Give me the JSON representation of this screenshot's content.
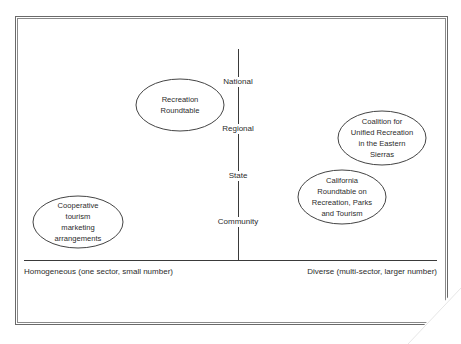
{
  "diagram": {
    "vertical_axis": {
      "levels": [
        {
          "label": "National",
          "y": 82
        },
        {
          "label": "Regional",
          "y": 129
        },
        {
          "label": "State",
          "y": 176
        },
        {
          "label": "Community",
          "y": 222
        }
      ]
    },
    "horizontal_axis": {
      "left_label": "Homogeneous (one sector, small number)",
      "right_label": "Diverse (multi-sector, larger number)"
    },
    "nodes": [
      {
        "id": "recreation-roundtable",
        "label": "Recreation\nRoundtable",
        "cx": 180,
        "cy": 105,
        "rx": 44,
        "ry": 26
      },
      {
        "id": "coalition-eastern-sierras",
        "label": "Coalition for\nUnified Recreation\nin the Eastern\nSierras",
        "cx": 382,
        "cy": 138,
        "rx": 44,
        "ry": 27
      },
      {
        "id": "california-roundtable",
        "label": "California\nRoundtable on\nRecreation, Parks\nand Tourism",
        "cx": 342,
        "cy": 197,
        "rx": 44,
        "ry": 27
      },
      {
        "id": "cooperative-tourism",
        "label": "Cooperative\ntourism\nmarketing\narrangements",
        "cx": 78,
        "cy": 222,
        "rx": 45,
        "ry": 26
      }
    ]
  }
}
